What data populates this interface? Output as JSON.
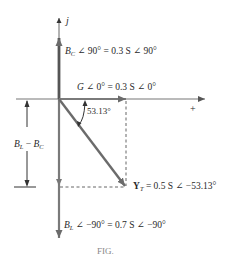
{
  "diagram": {
    "type": "phasor-admittance-diagram",
    "axes": {
      "imaginary_label": "j",
      "real_positive_label": "+"
    },
    "phasors": {
      "bc": {
        "symbol": "B",
        "subscript": "C",
        "polar": "∠ 90° = 0.3 S ∠ 90°"
      },
      "g": {
        "symbol": "G",
        "polar": "∠ 0° = 0.3 S ∠ 0°"
      },
      "yt": {
        "symbol": "Y",
        "subscript": "T",
        "polar": "= 0.5 S ∠ −53.13°"
      },
      "bl": {
        "symbol": "B",
        "subscript": "L",
        "polar": "∠ −90° = 0.7 S ∠ −90°"
      }
    },
    "angle_label": "53.13°",
    "dimension": {
      "bl_symbol": "B",
      "bl_subscript": "L",
      "minus": "−",
      "bc_symbol": "B",
      "bc_subscript": "C"
    },
    "caption": "FIG."
  },
  "colors": {
    "phasor": "#6b6b6b",
    "axis": "#555555",
    "text": "#2a2a2a"
  }
}
